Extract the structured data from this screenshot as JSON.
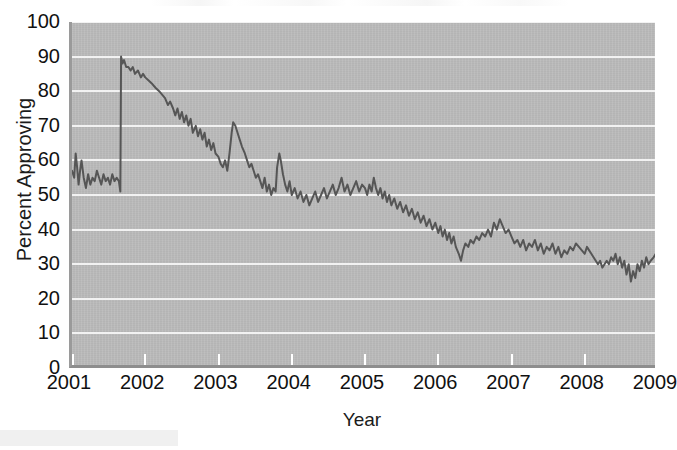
{
  "figure": {
    "background_color": "#ffffff",
    "plot_background_color": "#b6b6b6",
    "gridline_color": "#f2f2f2",
    "line_color": "#565656"
  },
  "axes": {
    "xlabel": "Year",
    "ylabel": "Percent Approving",
    "y_ticks": [
      100,
      90,
      80,
      70,
      60,
      50,
      40,
      30,
      20,
      10,
      0
    ],
    "x_ticks": [
      2001,
      2002,
      2003,
      2004,
      2005,
      2006,
      2007,
      2008,
      2009
    ],
    "xlim": [
      2001,
      2009
    ],
    "ylim": [
      0,
      100
    ]
  },
  "chart_data": {
    "type": "line",
    "title": "",
    "xlabel": "Year",
    "ylabel": "Percent Approving",
    "xlim": [
      2001,
      2009
    ],
    "ylim": [
      0,
      100
    ],
    "grid": "horizontal",
    "legend": "none",
    "series": [
      {
        "name": "Percent Approving",
        "color": "#565656",
        "points": [
          [
            2001.0,
            57
          ],
          [
            2001.03,
            55
          ],
          [
            2001.05,
            62
          ],
          [
            2001.07,
            58
          ],
          [
            2001.09,
            53
          ],
          [
            2001.11,
            57
          ],
          [
            2001.13,
            60
          ],
          [
            2001.16,
            55
          ],
          [
            2001.19,
            52
          ],
          [
            2001.22,
            56
          ],
          [
            2001.25,
            53
          ],
          [
            2001.28,
            55
          ],
          [
            2001.31,
            54
          ],
          [
            2001.34,
            57
          ],
          [
            2001.37,
            55
          ],
          [
            2001.4,
            53
          ],
          [
            2001.43,
            56
          ],
          [
            2001.46,
            54
          ],
          [
            2001.49,
            55
          ],
          [
            2001.52,
            53
          ],
          [
            2001.55,
            56
          ],
          [
            2001.58,
            54
          ],
          [
            2001.61,
            55
          ],
          [
            2001.64,
            54
          ],
          [
            2001.66,
            51
          ],
          [
            2001.67,
            90
          ],
          [
            2001.69,
            88
          ],
          [
            2001.71,
            89
          ],
          [
            2001.74,
            87
          ],
          [
            2001.77,
            87
          ],
          [
            2001.8,
            86
          ],
          [
            2001.83,
            87
          ],
          [
            2001.86,
            85
          ],
          [
            2001.9,
            86
          ],
          [
            2001.94,
            84
          ],
          [
            2001.97,
            85
          ],
          [
            2002.0,
            84
          ],
          [
            2002.05,
            83
          ],
          [
            2002.1,
            82
          ],
          [
            2002.14,
            81
          ],
          [
            2002.19,
            80
          ],
          [
            2002.23,
            79
          ],
          [
            2002.27,
            78
          ],
          [
            2002.31,
            76
          ],
          [
            2002.34,
            77
          ],
          [
            2002.38,
            75
          ],
          [
            2002.41,
            73
          ],
          [
            2002.44,
            75
          ],
          [
            2002.47,
            72
          ],
          [
            2002.5,
            74
          ],
          [
            2002.53,
            71
          ],
          [
            2002.56,
            73
          ],
          [
            2002.59,
            70
          ],
          [
            2002.62,
            72
          ],
          [
            2002.65,
            68
          ],
          [
            2002.69,
            70
          ],
          [
            2002.72,
            67
          ],
          [
            2002.75,
            69
          ],
          [
            2002.78,
            66
          ],
          [
            2002.81,
            68
          ],
          [
            2002.84,
            64
          ],
          [
            2002.87,
            66
          ],
          [
            2002.9,
            63
          ],
          [
            2002.93,
            65
          ],
          [
            2002.96,
            62
          ],
          [
            2003.0,
            61
          ],
          [
            2003.03,
            59
          ],
          [
            2003.06,
            58
          ],
          [
            2003.09,
            60
          ],
          [
            2003.12,
            57
          ],
          [
            2003.15,
            62
          ],
          [
            2003.18,
            68
          ],
          [
            2003.2,
            71
          ],
          [
            2003.23,
            70
          ],
          [
            2003.26,
            68
          ],
          [
            2003.29,
            66
          ],
          [
            2003.32,
            64
          ],
          [
            2003.36,
            62
          ],
          [
            2003.39,
            60
          ],
          [
            2003.42,
            58
          ],
          [
            2003.45,
            59
          ],
          [
            2003.48,
            57
          ],
          [
            2003.51,
            55
          ],
          [
            2003.54,
            56
          ],
          [
            2003.57,
            54
          ],
          [
            2003.6,
            52
          ],
          [
            2003.63,
            55
          ],
          [
            2003.66,
            51
          ],
          [
            2003.69,
            53
          ],
          [
            2003.72,
            50
          ],
          [
            2003.75,
            52
          ],
          [
            2003.78,
            51
          ],
          [
            2003.8,
            58
          ],
          [
            2003.83,
            62
          ],
          [
            2003.85,
            60
          ],
          [
            2003.88,
            56
          ],
          [
            2003.91,
            53
          ],
          [
            2003.94,
            51
          ],
          [
            2003.97,
            54
          ],
          [
            2004.0,
            50
          ],
          [
            2004.04,
            52
          ],
          [
            2004.08,
            49
          ],
          [
            2004.12,
            51
          ],
          [
            2004.16,
            48
          ],
          [
            2004.2,
            50
          ],
          [
            2004.24,
            47
          ],
          [
            2004.28,
            49
          ],
          [
            2004.32,
            51
          ],
          [
            2004.36,
            48
          ],
          [
            2004.4,
            50
          ],
          [
            2004.44,
            52
          ],
          [
            2004.48,
            49
          ],
          [
            2004.52,
            51
          ],
          [
            2004.56,
            53
          ],
          [
            2004.6,
            50
          ],
          [
            2004.64,
            52
          ],
          [
            2004.68,
            55
          ],
          [
            2004.72,
            51
          ],
          [
            2004.76,
            53
          ],
          [
            2004.8,
            50
          ],
          [
            2004.84,
            52
          ],
          [
            2004.88,
            54
          ],
          [
            2004.92,
            51
          ],
          [
            2004.96,
            53
          ],
          [
            2005.0,
            52
          ],
          [
            2005.03,
            50
          ],
          [
            2005.06,
            53
          ],
          [
            2005.09,
            51
          ],
          [
            2005.12,
            55
          ],
          [
            2005.15,
            52
          ],
          [
            2005.18,
            50
          ],
          [
            2005.21,
            52
          ],
          [
            2005.24,
            49
          ],
          [
            2005.27,
            51
          ],
          [
            2005.3,
            48
          ],
          [
            2005.33,
            50
          ],
          [
            2005.36,
            47
          ],
          [
            2005.4,
            49
          ],
          [
            2005.44,
            46
          ],
          [
            2005.48,
            48
          ],
          [
            2005.52,
            45
          ],
          [
            2005.56,
            47
          ],
          [
            2005.6,
            44
          ],
          [
            2005.64,
            46
          ],
          [
            2005.68,
            43
          ],
          [
            2005.72,
            45
          ],
          [
            2005.76,
            42
          ],
          [
            2005.8,
            44
          ],
          [
            2005.84,
            41
          ],
          [
            2005.88,
            43
          ],
          [
            2005.92,
            40
          ],
          [
            2005.96,
            42
          ],
          [
            2006.0,
            39
          ],
          [
            2006.03,
            41
          ],
          [
            2006.06,
            38
          ],
          [
            2006.09,
            40
          ],
          [
            2006.12,
            37
          ],
          [
            2006.15,
            39
          ],
          [
            2006.18,
            36
          ],
          [
            2006.21,
            38
          ],
          [
            2006.24,
            35
          ],
          [
            2006.28,
            33
          ],
          [
            2006.31,
            31
          ],
          [
            2006.34,
            34
          ],
          [
            2006.37,
            36
          ],
          [
            2006.41,
            35
          ],
          [
            2006.44,
            37
          ],
          [
            2006.48,
            36
          ],
          [
            2006.52,
            38
          ],
          [
            2006.56,
            37
          ],
          [
            2006.6,
            39
          ],
          [
            2006.64,
            38
          ],
          [
            2006.68,
            40
          ],
          [
            2006.72,
            38
          ],
          [
            2006.76,
            42
          ],
          [
            2006.8,
            40
          ],
          [
            2006.84,
            43
          ],
          [
            2006.88,
            41
          ],
          [
            2006.92,
            39
          ],
          [
            2006.96,
            40
          ],
          [
            2007.0,
            38
          ],
          [
            2007.04,
            36
          ],
          [
            2007.08,
            37
          ],
          [
            2007.12,
            35
          ],
          [
            2007.16,
            37
          ],
          [
            2007.2,
            34
          ],
          [
            2007.24,
            36
          ],
          [
            2007.28,
            35
          ],
          [
            2007.32,
            37
          ],
          [
            2007.36,
            34
          ],
          [
            2007.4,
            36
          ],
          [
            2007.44,
            33
          ],
          [
            2007.48,
            35
          ],
          [
            2007.52,
            34
          ],
          [
            2007.56,
            36
          ],
          [
            2007.6,
            33
          ],
          [
            2007.64,
            35
          ],
          [
            2007.68,
            32
          ],
          [
            2007.72,
            34
          ],
          [
            2007.76,
            33
          ],
          [
            2007.8,
            35
          ],
          [
            2007.84,
            34
          ],
          [
            2007.88,
            36
          ],
          [
            2007.92,
            35
          ],
          [
            2007.96,
            34
          ],
          [
            2008.0,
            33
          ],
          [
            2008.03,
            35
          ],
          [
            2008.06,
            34
          ],
          [
            2008.09,
            33
          ],
          [
            2008.12,
            32
          ],
          [
            2008.15,
            31
          ],
          [
            2008.18,
            30
          ],
          [
            2008.21,
            31
          ],
          [
            2008.24,
            29
          ],
          [
            2008.27,
            30
          ],
          [
            2008.3,
            31
          ],
          [
            2008.33,
            30
          ],
          [
            2008.36,
            32
          ],
          [
            2008.39,
            31
          ],
          [
            2008.42,
            33
          ],
          [
            2008.45,
            30
          ],
          [
            2008.48,
            32
          ],
          [
            2008.51,
            29
          ],
          [
            2008.54,
            31
          ],
          [
            2008.57,
            27
          ],
          [
            2008.6,
            30
          ],
          [
            2008.63,
            25
          ],
          [
            2008.66,
            28
          ],
          [
            2008.69,
            26
          ],
          [
            2008.72,
            30
          ],
          [
            2008.75,
            28
          ],
          [
            2008.78,
            31
          ],
          [
            2008.81,
            29
          ],
          [
            2008.84,
            32
          ],
          [
            2008.87,
            30
          ],
          [
            2008.9,
            31
          ],
          [
            2008.94,
            32
          ],
          [
            2008.97,
            33
          ]
        ]
      }
    ],
    "annotations": [
      {
        "label": "sharp rise to about 90 percent in late 2001",
        "x": 2001.67,
        "y": 90
      },
      {
        "label": "secondary peak about 71 percent in early 2003",
        "x": 2003.2,
        "y": 71
      },
      {
        "label": "low point about 25 percent in late 2008",
        "x": 2008.63,
        "y": 25
      }
    ]
  }
}
